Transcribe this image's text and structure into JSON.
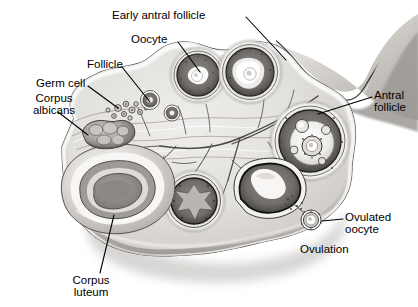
{
  "figure": {
    "type": "anatomical-diagram",
    "style": "grayscale-pen-and-ink",
    "background_color": "#ffffff",
    "ink_color": "#000000"
  },
  "labels": [
    {
      "id": "early-antral-follicle",
      "text": "Early antral follicle",
      "align": "left",
      "x": 112,
      "y": 9,
      "leader": {
        "from": [
          246,
          17
        ],
        "to": [
          286,
          60
        ]
      }
    },
    {
      "id": "oocyte",
      "text": "Oocyte",
      "align": "left",
      "x": 131,
      "y": 33,
      "leader": {
        "from": [
          178,
          42
        ],
        "to": [
          200,
          72
        ]
      }
    },
    {
      "id": "follicle",
      "text": "Follicle",
      "align": "left",
      "x": 87,
      "y": 58,
      "leader": {
        "from": [
          122,
          67
        ],
        "to": [
          150,
          102
        ]
      }
    },
    {
      "id": "germ-cell",
      "text": "Germ cell",
      "align": "left",
      "x": 36,
      "y": 77,
      "leader": {
        "from": [
          88,
          86
        ],
        "to": [
          118,
          108
        ]
      }
    },
    {
      "id": "corpus-albicans",
      "text": "Corpus\nalbicans",
      "align": "left",
      "x": 19,
      "y": 92,
      "leader": {
        "from": [
          58,
          112
        ],
        "to": [
          88,
          135
        ]
      }
    },
    {
      "id": "antral-follicle",
      "text": "Antral\nfollicle",
      "align": "left",
      "x": 374,
      "y": 89,
      "leader": {
        "from": [
          372,
          97
        ],
        "to": [
          318,
          114
        ]
      }
    },
    {
      "id": "ovulated-oocyte",
      "text": "Ovulated\noocyte",
      "align": "left",
      "x": 345,
      "y": 211,
      "leader": {
        "from": [
          343,
          219
        ],
        "to": [
          322,
          221
        ]
      }
    },
    {
      "id": "ovulation",
      "text": "Ovulation",
      "align": "left",
      "x": 300,
      "y": 243,
      "leader": null
    },
    {
      "id": "corpus-luteum",
      "text": "Corpus\nluteum",
      "align": "left",
      "x": 60,
      "y": 274,
      "leader": {
        "from": [
          100,
          273
        ],
        "to": [
          114,
          215
        ]
      }
    }
  ],
  "structures": [
    {
      "id": "ovary-body",
      "name": "ovary-stroma",
      "note": "lobulated oval body of the ovary"
    },
    {
      "id": "hilum",
      "name": "hilum-mesovarium",
      "note": "banded mesovarium / hilum at upper right with vessels entering"
    },
    {
      "id": "vascular-tree",
      "name": "ovarian-blood-vessels",
      "note": "branching vessels radiating through the medulla"
    },
    {
      "id": "germ-cells",
      "name": "germ-cell-cluster",
      "note": "small cluster of primordial germ cells, upper left cortex"
    },
    {
      "id": "primary-follicle",
      "name": "primary-follicle",
      "note": "small follicle with central oocyte"
    },
    {
      "id": "primary-follicle2",
      "name": "primary-follicle-2",
      "note": "second small follicle"
    },
    {
      "id": "early-antral-1",
      "name": "early-antral-follicle",
      "note": "upper-left large follicle with antrum"
    },
    {
      "id": "early-antral-2",
      "name": "early-antral-follicle-2",
      "note": "upper-right large follicle with antrum and oocyte"
    },
    {
      "id": "antral-follicle",
      "name": "antral-follicle",
      "note": "right side mature follicle with large antrum and cumulus oophorus"
    },
    {
      "id": "graafian",
      "name": "mature-graafian-follicle",
      "note": "lower-centre follicle, star-shaped antrum"
    },
    {
      "id": "rupturing",
      "name": "rupturing-follicle",
      "note": "lower-right follicle releasing the oocyte"
    },
    {
      "id": "ovulated-oocyte",
      "name": "ovulated-oocyte",
      "note": "free oocyte with corona radiata outside the ovary surface"
    },
    {
      "id": "corpus-luteum",
      "name": "corpus-luteum",
      "note": "large convoluted yellow body, lower left"
    },
    {
      "id": "corpus-albicans",
      "name": "corpus-albicans",
      "note": "small scarred lobulated body, upper left"
    }
  ]
}
